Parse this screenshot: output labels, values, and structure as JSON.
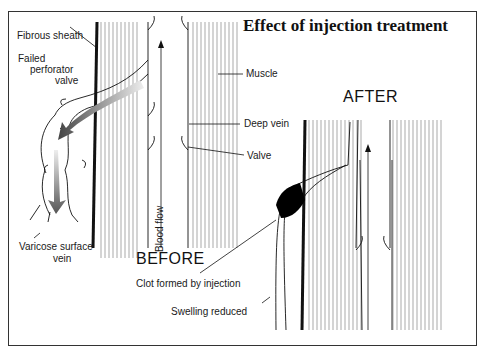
{
  "title": "Effect of injection treatment",
  "panels": {
    "before": {
      "heading": "BEFORE",
      "labels": {
        "fibrous_sheath": "Fibrous sheath",
        "failed_perforator_line1": "Failed",
        "failed_perforator_line2": "perforator",
        "failed_perforator_line3": "valve",
        "varicose_line1": "Varicose surface",
        "varicose_line2": "vein",
        "muscle": "Muscle",
        "deep_vein": "Deep vein",
        "valve": "Valve",
        "blood_flow": "Blood flow"
      }
    },
    "after": {
      "heading": "AFTER",
      "labels": {
        "clot": "Clot formed by injection",
        "swelling": "Swelling reduced"
      }
    }
  },
  "colors": {
    "line": "#1a1a1a",
    "frame": "#333333",
    "arrow_dark": "#555555",
    "arrow_light": "#e0e0e0",
    "clot": "#000000"
  }
}
